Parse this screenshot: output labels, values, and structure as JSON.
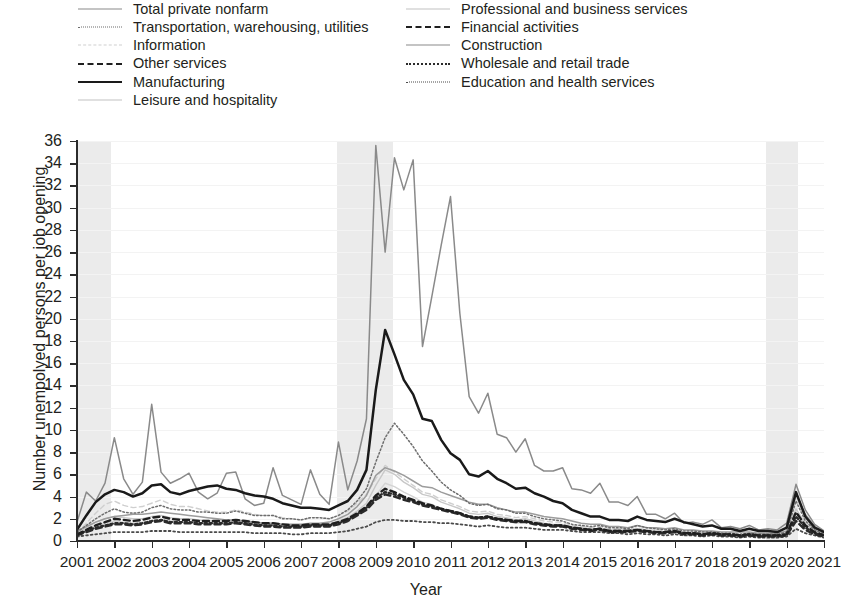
{
  "axes": {
    "x_title": "Year",
    "y_title": "Number unempolyed persons per job opening",
    "x_ticks": [
      "2001",
      "2002",
      "2003",
      "2004",
      "2005",
      "2006",
      "2007",
      "2008",
      "2009",
      "2010",
      "2011",
      "2012",
      "2013",
      "2014",
      "2015",
      "2016",
      "2017",
      "2018",
      "2019",
      "2020",
      "2021"
    ],
    "y_ticks": [
      "0",
      "2",
      "4",
      "6",
      "8",
      "10",
      "12",
      "14",
      "16",
      "18",
      "20",
      "22",
      "24",
      "26",
      "28",
      "30",
      "32",
      "34",
      "36"
    ]
  },
  "legend": {
    "left_column": [
      {
        "label": "Total private nonfarm",
        "style": "ls-solid-gray"
      },
      {
        "label": "Transportation, warehousing, utilities",
        "style": "ls-dot-fine"
      },
      {
        "label": "Information",
        "style": "ls-dash-faint"
      },
      {
        "label": "Other services",
        "style": "ls-dash-bold"
      },
      {
        "label": "Manufacturing",
        "style": "ls-solid-black"
      },
      {
        "label": "Leisure and hospitality",
        "style": "ls-solid-faint"
      }
    ],
    "right_column": [
      {
        "label": "Professional and business services",
        "style": "ls-solid-faint"
      },
      {
        "label": "Financial activities",
        "style": "ls-dash-bold"
      },
      {
        "label": "Construction",
        "style": "ls-solid-gray"
      },
      {
        "label": "Wholesale and retail trade",
        "style": "ls-dot-med"
      },
      {
        "label": "Education and health services",
        "style": "ls-dot-small"
      }
    ]
  },
  "chart_data": {
    "type": "line",
    "title": "",
    "xlabel": "Year",
    "ylabel": "Number unempolyed persons per job opening",
    "xlim": [
      2001,
      2021
    ],
    "ylim": [
      0,
      36
    ],
    "grid": true,
    "legend_position": "top",
    "shaded_regions": [
      {
        "name": "recession-2001",
        "x0": 2001.0,
        "x1": 2001.92,
        "color": "#ebebeb"
      },
      {
        "name": "recession-2008",
        "x0": 2007.95,
        "x1": 2009.45,
        "color": "#ebebeb"
      },
      {
        "name": "recession-2020",
        "x0": 2019.45,
        "x1": 2020.3,
        "color": "#ebebeb"
      }
    ],
    "x": [
      2001.0,
      2001.25,
      2001.5,
      2001.75,
      2002.0,
      2002.25,
      2002.5,
      2002.75,
      2003.0,
      2003.25,
      2003.5,
      2003.75,
      2004.0,
      2004.25,
      2004.5,
      2004.75,
      2005.0,
      2005.25,
      2005.5,
      2005.75,
      2006.0,
      2006.25,
      2006.5,
      2006.75,
      2007.0,
      2007.25,
      2007.5,
      2007.75,
      2008.0,
      2008.25,
      2008.5,
      2008.75,
      2009.0,
      2009.25,
      2009.5,
      2009.75,
      2010.0,
      2010.25,
      2010.5,
      2010.75,
      2011.0,
      2011.25,
      2011.5,
      2011.75,
      2012.0,
      2012.25,
      2012.5,
      2012.75,
      2013.0,
      2013.25,
      2013.5,
      2013.75,
      2014.0,
      2014.25,
      2014.5,
      2014.75,
      2015.0,
      2015.25,
      2015.5,
      2015.75,
      2016.0,
      2016.25,
      2016.5,
      2016.75,
      2017.0,
      2017.25,
      2017.5,
      2017.75,
      2018.0,
      2018.25,
      2018.5,
      2018.75,
      2019.0,
      2019.25,
      2019.5,
      2019.75,
      2020.0,
      2020.25,
      2020.5,
      2020.75,
      2021.0
    ],
    "series": [
      {
        "name": "Construction",
        "style": "ls-solid-gray",
        "color": "#8a8a8a",
        "values": [
          1.7,
          4.4,
          3.6,
          5.2,
          9.3,
          5.6,
          4.2,
          5.3,
          12.3,
          6.2,
          5.2,
          5.6,
          6.1,
          4.4,
          3.8,
          4.3,
          6.1,
          6.2,
          3.8,
          3.2,
          3.4,
          6.6,
          4.1,
          3.7,
          3.3,
          6.4,
          4.2,
          3.3,
          8.9,
          4.6,
          7.2,
          11.0,
          35.6,
          26.0,
          34.5,
          31.6,
          34.3,
          17.5,
          22.0,
          26.6,
          31.0,
          20.5,
          13.0,
          11.5,
          13.3,
          9.6,
          9.3,
          8.0,
          9.2,
          6.8,
          6.3,
          6.3,
          6.6,
          4.7,
          4.6,
          4.3,
          5.2,
          3.5,
          3.5,
          3.2,
          4.0,
          2.4,
          2.4,
          2.0,
          2.5,
          1.6,
          1.7,
          1.5,
          1.9,
          1.2,
          1.3,
          1.1,
          1.4,
          1.0,
          1.1,
          1.0,
          1.6,
          5.1,
          2.8,
          1.5,
          0.9
        ]
      },
      {
        "name": "Manufacturing",
        "style": "ls-solid-black",
        "color": "#1a1a1a",
        "values": [
          1.0,
          2.3,
          3.5,
          4.2,
          4.6,
          4.4,
          4.0,
          4.3,
          5.0,
          5.1,
          4.4,
          4.2,
          4.5,
          4.7,
          4.9,
          5.0,
          4.7,
          4.6,
          4.3,
          4.1,
          4.0,
          3.8,
          3.4,
          3.2,
          3.0,
          3.0,
          2.9,
          2.8,
          3.2,
          3.6,
          4.6,
          6.4,
          13.6,
          19.0,
          16.8,
          14.5,
          13.2,
          11.0,
          10.8,
          9.1,
          7.9,
          7.3,
          6.0,
          5.8,
          6.3,
          5.6,
          5.2,
          4.7,
          4.8,
          4.3,
          4.0,
          3.6,
          3.4,
          2.8,
          2.5,
          2.2,
          2.2,
          1.9,
          1.9,
          1.8,
          2.2,
          1.9,
          1.8,
          1.7,
          2.0,
          1.7,
          1.5,
          1.3,
          1.4,
          1.1,
          1.1,
          0.9,
          1.1,
          0.9,
          0.9,
          0.8,
          1.2,
          4.4,
          2.2,
          1.2,
          0.8
        ]
      },
      {
        "name": "Total private nonfarm",
        "style": "ls-solid-gray",
        "color": "#9c9c9c",
        "values": [
          0.9,
          1.3,
          1.7,
          2.0,
          2.2,
          2.3,
          2.4,
          2.4,
          2.5,
          2.6,
          2.5,
          2.4,
          2.3,
          2.2,
          2.1,
          2.0,
          1.9,
          1.9,
          1.8,
          1.7,
          1.6,
          1.6,
          1.5,
          1.5,
          1.5,
          1.6,
          1.6,
          1.7,
          2.0,
          2.4,
          3.1,
          4.1,
          5.9,
          6.6,
          6.3,
          5.9,
          5.4,
          4.9,
          4.8,
          4.4,
          4.1,
          3.8,
          3.5,
          3.3,
          3.3,
          3.0,
          2.8,
          2.6,
          2.6,
          2.4,
          2.2,
          2.1,
          2.0,
          1.8,
          1.6,
          1.5,
          1.5,
          1.3,
          1.3,
          1.2,
          1.4,
          1.2,
          1.2,
          1.1,
          1.2,
          1.0,
          1.0,
          0.9,
          0.9,
          0.8,
          0.8,
          0.8,
          0.8,
          0.7,
          0.7,
          0.7,
          0.9,
          4.2,
          2.4,
          1.3,
          0.8
        ]
      },
      {
        "name": "Transportation, warehousing, utilities",
        "style": "ls-dot-fine",
        "color": "#6d6d6d",
        "values": [
          0.8,
          1.4,
          2.0,
          2.5,
          2.9,
          2.6,
          2.5,
          2.6,
          3.0,
          3.2,
          2.9,
          2.8,
          2.8,
          2.6,
          2.6,
          2.5,
          2.5,
          2.7,
          2.5,
          2.3,
          2.3,
          2.3,
          2.0,
          2.0,
          1.9,
          2.1,
          2.1,
          2.0,
          2.3,
          2.8,
          3.6,
          4.7,
          7.1,
          9.3,
          10.6,
          9.6,
          8.5,
          7.2,
          6.3,
          5.3,
          4.6,
          4.1,
          3.4,
          3.2,
          3.3,
          2.9,
          2.8,
          2.5,
          2.5,
          2.2,
          2.0,
          1.9,
          1.8,
          1.5,
          1.4,
          1.3,
          1.4,
          1.2,
          1.2,
          1.1,
          1.4,
          1.2,
          1.1,
          1.0,
          1.1,
          0.9,
          0.9,
          0.8,
          0.8,
          0.7,
          0.7,
          0.6,
          0.7,
          0.6,
          0.6,
          0.6,
          0.8,
          3.6,
          1.8,
          1.0,
          0.6
        ]
      },
      {
        "name": "Professional and business services",
        "style": "ls-solid-faint",
        "color": "#c8c8c8",
        "values": [
          0.7,
          1.2,
          1.7,
          2.0,
          2.2,
          2.1,
          2.0,
          2.0,
          2.2,
          2.3,
          2.1,
          2.0,
          2.0,
          1.9,
          1.8,
          1.8,
          1.8,
          1.9,
          1.8,
          1.7,
          1.6,
          1.6,
          1.5,
          1.4,
          1.4,
          1.5,
          1.5,
          1.5,
          1.8,
          2.1,
          2.7,
          3.4,
          5.0,
          6.4,
          6.0,
          5.3,
          4.8,
          4.2,
          4.0,
          3.5,
          3.2,
          2.9,
          2.5,
          2.4,
          2.5,
          2.2,
          2.1,
          1.9,
          2.0,
          1.8,
          1.6,
          1.5,
          1.5,
          1.3,
          1.2,
          1.1,
          1.1,
          1.0,
          1.0,
          0.9,
          1.1,
          0.9,
          0.9,
          0.8,
          0.9,
          0.7,
          0.7,
          0.6,
          0.7,
          0.6,
          0.6,
          0.5,
          0.6,
          0.5,
          0.5,
          0.5,
          0.7,
          2.9,
          1.6,
          0.9,
          0.6
        ]
      },
      {
        "name": "Leisure and hospitality",
        "style": "ls-solid-faint",
        "color": "#d4d4d4",
        "values": [
          0.6,
          1.0,
          1.4,
          1.6,
          1.8,
          1.7,
          1.6,
          1.7,
          1.8,
          1.9,
          1.8,
          1.7,
          1.7,
          1.6,
          1.6,
          1.5,
          1.5,
          1.6,
          1.5,
          1.4,
          1.4,
          1.4,
          1.3,
          1.2,
          1.2,
          1.3,
          1.3,
          1.3,
          1.5,
          1.8,
          2.3,
          2.9,
          4.1,
          5.2,
          4.9,
          4.4,
          4.0,
          3.5,
          3.3,
          2.9,
          2.6,
          2.4,
          2.1,
          2.0,
          2.1,
          1.9,
          1.8,
          1.6,
          1.7,
          1.5,
          1.4,
          1.3,
          1.3,
          1.1,
          1.0,
          0.9,
          1.0,
          0.8,
          0.8,
          0.8,
          0.9,
          0.8,
          0.8,
          0.7,
          0.8,
          0.6,
          0.6,
          0.6,
          0.6,
          0.5,
          0.5,
          0.5,
          0.5,
          0.4,
          0.4,
          0.4,
          0.6,
          4.0,
          2.0,
          1.0,
          0.6
        ]
      },
      {
        "name": "Information",
        "style": "ls-dash-faint",
        "color": "#cfcfcf",
        "values": [
          0.7,
          1.6,
          2.5,
          3.3,
          3.6,
          3.2,
          3.0,
          3.1,
          3.4,
          3.7,
          3.3,
          3.1,
          3.1,
          2.9,
          2.7,
          2.6,
          2.6,
          2.8,
          2.6,
          2.4,
          2.3,
          2.3,
          2.1,
          2.0,
          1.9,
          2.1,
          2.1,
          2.0,
          2.3,
          2.7,
          3.4,
          4.2,
          5.6,
          6.8,
          6.2,
          5.6,
          5.0,
          4.4,
          4.2,
          3.7,
          3.4,
          3.1,
          2.7,
          2.6,
          2.7,
          2.4,
          2.3,
          2.1,
          2.2,
          2.0,
          1.8,
          1.7,
          1.7,
          1.4,
          1.3,
          1.2,
          1.3,
          1.1,
          1.1,
          1.0,
          1.2,
          1.0,
          1.0,
          0.9,
          1.0,
          0.8,
          0.8,
          0.7,
          0.8,
          0.6,
          0.6,
          0.6,
          0.6,
          0.5,
          0.5,
          0.5,
          0.7,
          2.6,
          1.5,
          0.9,
          0.6
        ]
      },
      {
        "name": "Other services",
        "style": "ls-dash-bold",
        "color": "#1f1f1f",
        "values": [
          0.6,
          1.0,
          1.4,
          1.7,
          2.0,
          1.9,
          1.8,
          1.9,
          2.1,
          2.2,
          2.0,
          1.9,
          1.9,
          1.8,
          1.8,
          1.8,
          1.8,
          1.9,
          1.8,
          1.7,
          1.6,
          1.6,
          1.5,
          1.4,
          1.4,
          1.5,
          1.5,
          1.5,
          1.7,
          2.0,
          2.5,
          3.1,
          4.1,
          4.7,
          4.4,
          4.0,
          3.7,
          3.4,
          3.2,
          2.9,
          2.7,
          2.5,
          2.2,
          2.1,
          2.2,
          2.0,
          1.9,
          1.8,
          1.8,
          1.6,
          1.5,
          1.4,
          1.4,
          1.2,
          1.1,
          1.0,
          1.1,
          0.9,
          0.9,
          0.9,
          1.0,
          0.9,
          0.8,
          0.8,
          0.9,
          0.7,
          0.7,
          0.6,
          0.7,
          0.6,
          0.6,
          0.5,
          0.6,
          0.5,
          0.5,
          0.5,
          0.6,
          2.6,
          1.4,
          0.8,
          0.5
        ]
      },
      {
        "name": "Financial activities",
        "style": "ls-dash-bold",
        "color": "#2a2a2a",
        "values": [
          0.5,
          0.8,
          1.1,
          1.3,
          1.5,
          1.5,
          1.4,
          1.5,
          1.7,
          1.8,
          1.6,
          1.6,
          1.6,
          1.5,
          1.5,
          1.5,
          1.5,
          1.6,
          1.5,
          1.4,
          1.3,
          1.3,
          1.2,
          1.2,
          1.2,
          1.3,
          1.3,
          1.3,
          1.5,
          1.8,
          2.3,
          2.8,
          3.7,
          4.2,
          4.0,
          3.7,
          3.5,
          3.2,
          3.0,
          2.8,
          2.6,
          2.4,
          2.1,
          2.0,
          2.1,
          1.9,
          1.8,
          1.7,
          1.7,
          1.5,
          1.4,
          1.3,
          1.3,
          1.1,
          1.0,
          0.9,
          1.0,
          0.8,
          0.8,
          0.8,
          0.9,
          0.8,
          0.7,
          0.7,
          0.8,
          0.6,
          0.6,
          0.5,
          0.6,
          0.5,
          0.5,
          0.4,
          0.5,
          0.4,
          0.4,
          0.4,
          0.5,
          1.8,
          1.0,
          0.6,
          0.4
        ]
      },
      {
        "name": "Wholesale and retail trade",
        "style": "ls-dot-med",
        "color": "#2b2b2b",
        "values": [
          0.6,
          0.9,
          1.2,
          1.4,
          1.6,
          1.6,
          1.5,
          1.6,
          1.8,
          1.9,
          1.7,
          1.7,
          1.7,
          1.6,
          1.6,
          1.6,
          1.6,
          1.7,
          1.6,
          1.5,
          1.4,
          1.4,
          1.3,
          1.3,
          1.3,
          1.4,
          1.4,
          1.4,
          1.6,
          1.9,
          2.4,
          3.0,
          3.9,
          4.4,
          4.2,
          3.9,
          3.6,
          3.3,
          3.1,
          2.9,
          2.7,
          2.5,
          2.2,
          2.1,
          2.2,
          2.0,
          1.9,
          1.8,
          1.8,
          1.6,
          1.5,
          1.4,
          1.4,
          1.2,
          1.1,
          1.0,
          1.1,
          0.9,
          0.9,
          0.9,
          1.0,
          0.9,
          0.8,
          0.8,
          0.9,
          0.7,
          0.7,
          0.6,
          0.7,
          0.6,
          0.6,
          0.5,
          0.6,
          0.5,
          0.5,
          0.5,
          0.6,
          2.2,
          1.2,
          0.7,
          0.5
        ]
      },
      {
        "name": "Education and health services",
        "style": "ls-dot-small",
        "color": "#4a4a4a",
        "values": [
          0.4,
          0.5,
          0.6,
          0.7,
          0.8,
          0.8,
          0.8,
          0.8,
          0.9,
          0.9,
          0.9,
          0.8,
          0.8,
          0.8,
          0.8,
          0.8,
          0.8,
          0.8,
          0.8,
          0.7,
          0.7,
          0.7,
          0.7,
          0.6,
          0.6,
          0.7,
          0.7,
          0.7,
          0.8,
          0.9,
          1.1,
          1.3,
          1.7,
          1.9,
          1.9,
          1.8,
          1.8,
          1.7,
          1.7,
          1.6,
          1.6,
          1.5,
          1.4,
          1.3,
          1.4,
          1.3,
          1.2,
          1.2,
          1.2,
          1.1,
          1.0,
          1.0,
          1.0,
          0.9,
          0.8,
          0.8,
          0.8,
          0.7,
          0.7,
          0.6,
          0.7,
          0.6,
          0.6,
          0.5,
          0.6,
          0.5,
          0.5,
          0.4,
          0.5,
          0.4,
          0.4,
          0.3,
          0.4,
          0.3,
          0.3,
          0.3,
          0.4,
          1.1,
          0.7,
          0.5,
          0.3
        ]
      }
    ]
  }
}
